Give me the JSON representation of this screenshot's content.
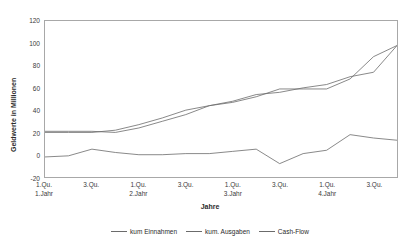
{
  "chart_data": {
    "type": "line",
    "title": "",
    "xlabel": "Jahre",
    "ylabel": "Geldwerte in Millionen",
    "ylim": [
      -20,
      120
    ],
    "ytick_values": [
      120,
      100,
      80,
      60,
      40,
      20,
      0,
      -20
    ],
    "ytick_labels": [
      "120",
      "100",
      "80",
      "60",
      "40",
      "20",
      "0",
      "-20"
    ],
    "grid": false,
    "legend_position": "bottom",
    "x_count": 16,
    "x_tick_positions": [
      1,
      3,
      5,
      7,
      9,
      11,
      13,
      15
    ],
    "x_tick_labels": [
      {
        "line1": "1.Qu.",
        "line2": "1.Jahr"
      },
      {
        "line1": "3.Qu.",
        "line2": ""
      },
      {
        "line1": "1.Qu.",
        "line2": "2.Jahr"
      },
      {
        "line1": "3.Qu.",
        "line2": ""
      },
      {
        "line1": "1.Qu.",
        "line2": "3.Jahr"
      },
      {
        "line1": "3.Qu.",
        "line2": ""
      },
      {
        "line1": "1.Qu.",
        "line2": "4.Jahr"
      },
      {
        "line1": "3.Qu.",
        "line2": ""
      }
    ],
    "x": [
      1,
      2,
      3,
      4,
      5,
      6,
      7,
      8,
      9,
      10,
      11,
      12,
      13,
      14,
      15,
      16
    ],
    "series": [
      {
        "name": "kum Einnahmen",
        "color": "#6b6b6b",
        "values": [
          21,
          21,
          21,
          20,
          24,
          30,
          36,
          44,
          47,
          52,
          59,
          59,
          59,
          68,
          88,
          98
        ]
      },
      {
        "name": "kum. Ausgaben",
        "color": "#6b6b6b",
        "values": [
          20,
          20,
          20,
          22,
          27,
          33,
          40,
          44,
          48,
          54,
          56,
          60,
          63,
          70,
          74,
          98
        ]
      },
      {
        "name": "Cash-Flow",
        "color": "#6b6b6b",
        "values": [
          -2,
          -1,
          5,
          2,
          0,
          0,
          1,
          1,
          3,
          5,
          -8,
          1,
          4,
          18,
          15,
          13
        ]
      }
    ],
    "legend_entries": [
      "kum Einnahmen",
      "kum. Ausgaben",
      "Cash-Flow"
    ]
  }
}
